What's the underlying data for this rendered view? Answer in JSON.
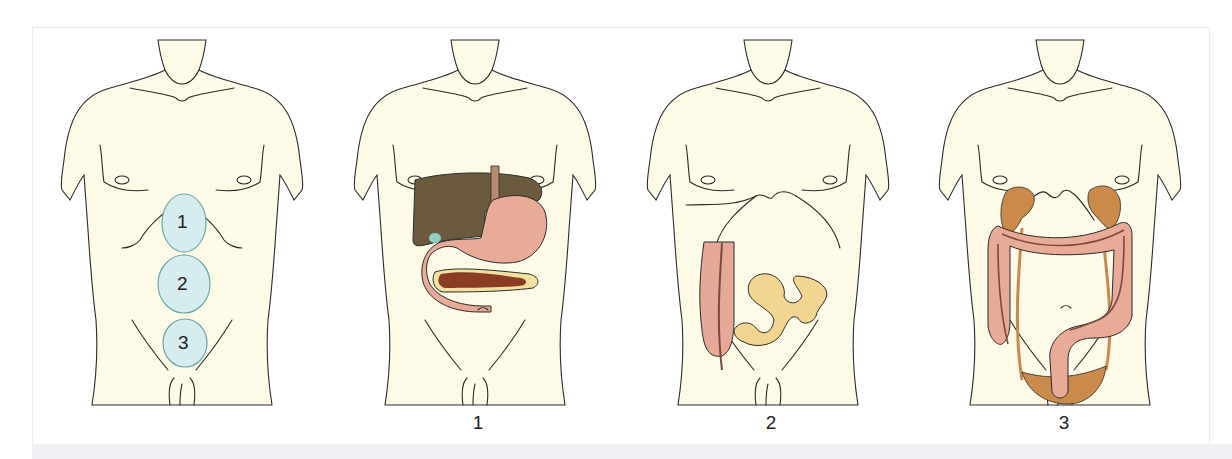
{
  "figure": {
    "background": "#ffffff",
    "skin_color": "#fdfbe8",
    "outline_color": "#2b2b2b",
    "panels": [
      {
        "id": "overview",
        "caption": "",
        "regions": [
          {
            "label": "1",
            "color": "#d6ecee"
          },
          {
            "label": "2",
            "color": "#d6ecee"
          },
          {
            "label": "3",
            "color": "#d6ecee"
          }
        ]
      },
      {
        "id": "region-1",
        "caption": "1",
        "organs": [
          {
            "name": "liver",
            "color": "#6b5a3e"
          },
          {
            "name": "gallbladder",
            "color": "#8fcfc4"
          },
          {
            "name": "esophagus",
            "color": "#e8a898"
          },
          {
            "name": "stomach",
            "color": "#e8ab98"
          },
          {
            "name": "duodenum",
            "color": "#e8ab98"
          },
          {
            "name": "pancreas",
            "color": "#efe2a0"
          },
          {
            "name": "splenic-vessels",
            "color": "#8a3d22"
          }
        ]
      },
      {
        "id": "region-2",
        "caption": "2",
        "organs": [
          {
            "name": "ascending-colon",
            "color": "#e6a898"
          },
          {
            "name": "small-intestine",
            "color": "#f3d592"
          }
        ]
      },
      {
        "id": "region-3",
        "caption": "3",
        "organs": [
          {
            "name": "kidneys",
            "color": "#c98a4b"
          },
          {
            "name": "ureters",
            "color": "#c98a4b"
          },
          {
            "name": "bladder",
            "color": "#c98a4b"
          },
          {
            "name": "colon",
            "color": "#e8ab98"
          }
        ]
      }
    ]
  }
}
